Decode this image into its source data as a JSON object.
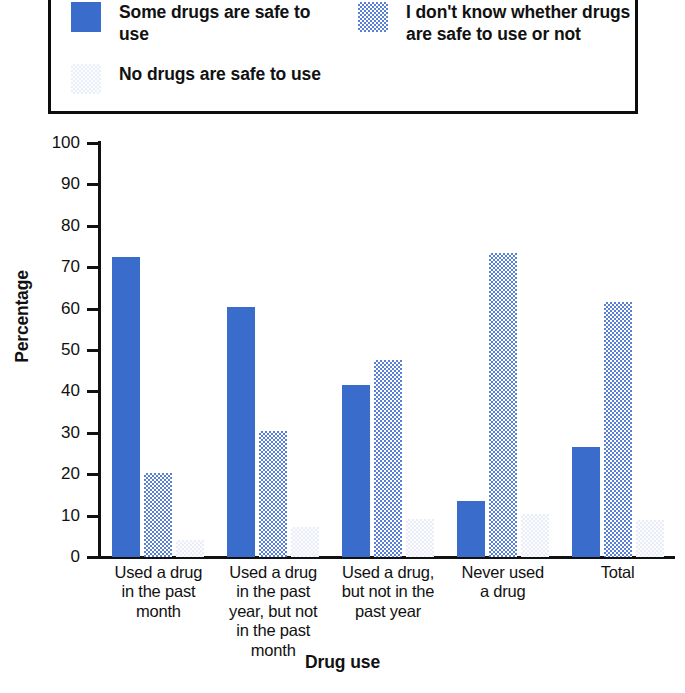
{
  "legend": {
    "entries": [
      {
        "label": "Some drugs are safe to use",
        "swatch": "solid-blue-swatch",
        "color": "#3a6ccc"
      },
      {
        "label": "I don't know whether drugs are safe to use or not",
        "swatch": "dotted-blue-swatch",
        "color": "#5a7fd6"
      },
      {
        "label": "No drugs are safe to use",
        "swatch": "faint-swatch",
        "color": "#e8edf7"
      }
    ]
  },
  "chart_data": {
    "type": "bar",
    "title": "",
    "xlabel": "Drug use",
    "ylabel": "Percentage",
    "ylim": [
      0,
      100
    ],
    "yticks": [
      0,
      10,
      20,
      30,
      40,
      50,
      60,
      70,
      80,
      90,
      100
    ],
    "ytick_labels": [
      "0",
      "10",
      "20",
      "30",
      "40",
      "50",
      "60",
      "70",
      "80",
      "90",
      "100"
    ],
    "grid": false,
    "legend_position": "top",
    "categories": [
      "Used a drug in the past month",
      "Used a drug in the past year, but not in the past month",
      "Used a drug, but not in the past year",
      "Never used a drug",
      "Total"
    ],
    "category_lines": [
      [
        "Used a drug",
        "in the past",
        "month"
      ],
      [
        "Used a drug",
        "in the past",
        "year, but not",
        "in the past",
        "month"
      ],
      [
        "Used a drug,",
        "but not in the",
        "past year"
      ],
      [
        "Never used",
        "a drug"
      ],
      [
        "Total"
      ]
    ],
    "series": [
      {
        "name": "Some drugs are safe to use",
        "values": [
          72.4,
          60.5,
          41.5,
          13.5,
          26.5
        ]
      },
      {
        "name": "I don't know whether drugs are safe to use or not",
        "values": [
          20.4,
          30.5,
          47.5,
          73.5,
          61.5
        ]
      },
      {
        "name": "No drugs are safe to use",
        "values": [
          4.2,
          7.3,
          9.2,
          10.5,
          9.0
        ]
      }
    ]
  }
}
